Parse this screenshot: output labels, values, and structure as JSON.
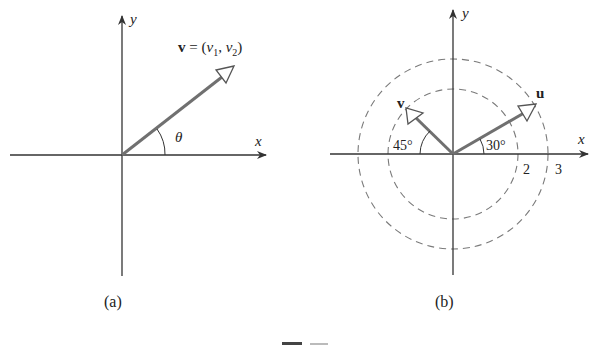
{
  "figure_a": {
    "caption": "(a)",
    "x_label": "x",
    "y_label": "y",
    "vector_label_bold": "v",
    "vector_label_rest": " = (",
    "v1": "v",
    "v1_sub": "1",
    "comma": ", ",
    "v2": "v",
    "v2_sub": "2",
    "close": ")",
    "angle_label": "θ"
  },
  "figure_b": {
    "caption": "(b)",
    "x_label": "x",
    "y_label": "y",
    "vector_u_label": "u",
    "vector_v_label": "v",
    "angle_u": "30°",
    "angle_v": "45°",
    "radius_inner_label": "2",
    "radius_outer_label": "3"
  },
  "colors": {
    "axis": "#333333",
    "vector": "#707070",
    "dashed_circle": "#7a7a7a"
  }
}
